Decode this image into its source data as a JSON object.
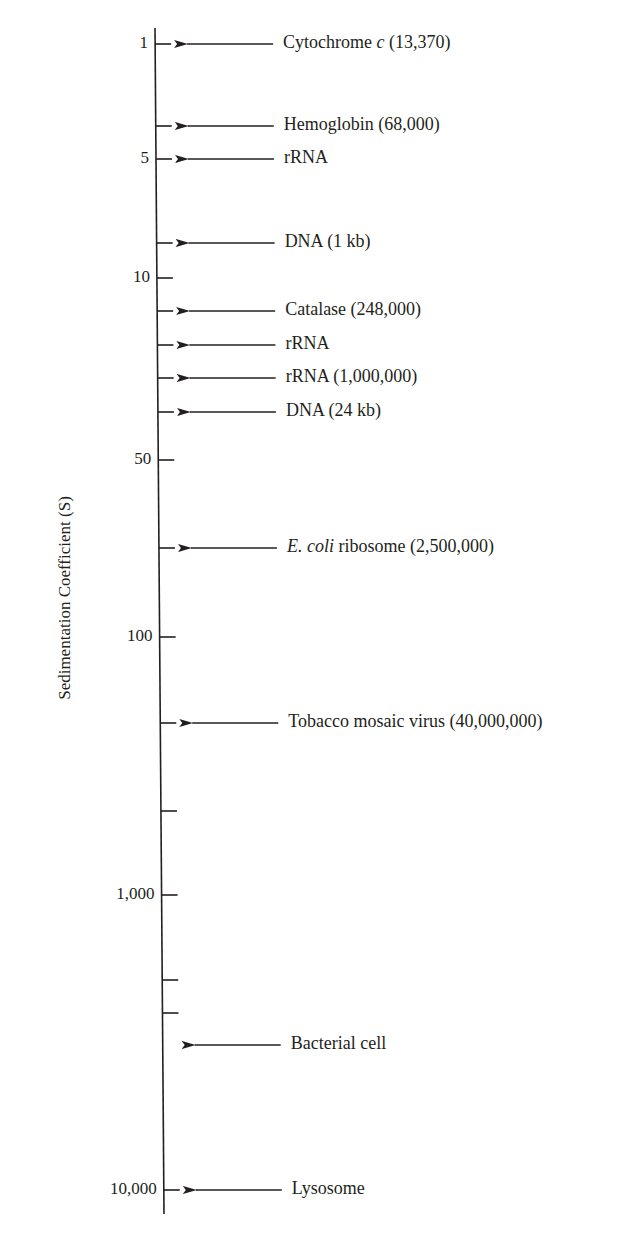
{
  "figure": {
    "axis_title": "Sedimentation Coefficient (S)",
    "axis": {
      "x_top": 155,
      "y_top": 28,
      "x_bottom": 164,
      "y_bottom": 1214
    },
    "ticks": [
      {
        "y": 44,
        "label": "1"
      },
      {
        "y": 126,
        "label": ""
      },
      {
        "y": 159,
        "label": "5"
      },
      {
        "y": 243,
        "label": ""
      },
      {
        "y": 278,
        "label": "10"
      },
      {
        "y": 311,
        "label": ""
      },
      {
        "y": 345,
        "label": ""
      },
      {
        "y": 378,
        "label": ""
      },
      {
        "y": 412,
        "label": ""
      },
      {
        "y": 460,
        "label": "50"
      },
      {
        "y": 548,
        "label": ""
      },
      {
        "y": 637,
        "label": "100"
      },
      {
        "y": 723,
        "label": ""
      },
      {
        "y": 811,
        "label": ""
      },
      {
        "y": 895,
        "label": "1,000"
      },
      {
        "y": 980,
        "label": ""
      },
      {
        "y": 1013,
        "label": ""
      },
      {
        "y": 1190,
        "label": "10,000"
      }
    ],
    "entries": [
      {
        "y": 44,
        "parts": [
          {
            "text": "Cytochrome ",
            "italic": false
          },
          {
            "text": "c",
            "italic": true
          },
          {
            "text": " (13,370)",
            "italic": false
          }
        ]
      },
      {
        "y": 126,
        "parts": [
          {
            "text": "Hemoglobin (68,000)",
            "italic": false
          }
        ]
      },
      {
        "y": 159,
        "parts": [
          {
            "text": "rRNA",
            "italic": false
          }
        ]
      },
      {
        "y": 243,
        "parts": [
          {
            "text": "DNA (1 kb)",
            "italic": false
          }
        ]
      },
      {
        "y": 311,
        "parts": [
          {
            "text": "Catalase (248,000)",
            "italic": false
          }
        ]
      },
      {
        "y": 345,
        "parts": [
          {
            "text": "rRNA",
            "italic": false
          }
        ]
      },
      {
        "y": 378,
        "parts": [
          {
            "text": "rRNA (1,000,000)",
            "italic": false
          }
        ]
      },
      {
        "y": 412,
        "parts": [
          {
            "text": "DNA (24 kb)",
            "italic": false
          }
        ]
      },
      {
        "y": 548,
        "parts": [
          {
            "text": "E. coli",
            "italic": true
          },
          {
            "text": " ribosome (2,500,000)",
            "italic": false
          }
        ]
      },
      {
        "y": 723,
        "parts": [
          {
            "text": "Tobacco mosaic virus (40,000,000)",
            "italic": false
          }
        ]
      },
      {
        "y": 1045,
        "parts": [
          {
            "text": "Bacterial cell",
            "italic": false
          }
        ]
      },
      {
        "y": 1190,
        "parts": [
          {
            "text": "Lysosome",
            "italic": false
          }
        ]
      }
    ]
  },
  "chart_data": {
    "type": "scale-diagram",
    "title": "",
    "ylabel": "Sedimentation Coefficient (S)",
    "scale": "log (schematic)",
    "axis_tick_labels": [
      "1",
      "5",
      "10",
      "50",
      "100",
      "1,000",
      "10,000"
    ],
    "items": [
      {
        "name": "Cytochrome c",
        "molecular_weight": "13,370",
        "approx_S": 1
      },
      {
        "name": "Hemoglobin",
        "molecular_weight": "68,000",
        "approx_S": 4
      },
      {
        "name": "rRNA",
        "molecular_weight": "",
        "approx_S": 5
      },
      {
        "name": "DNA (1 kb)",
        "molecular_weight": "",
        "approx_S": 7
      },
      {
        "name": "Catalase",
        "molecular_weight": "248,000",
        "approx_S": 11
      },
      {
        "name": "rRNA",
        "molecular_weight": "",
        "approx_S": 16
      },
      {
        "name": "rRNA",
        "molecular_weight": "1,000,000",
        "approx_S": 23
      },
      {
        "name": "DNA (24 kb)",
        "molecular_weight": "",
        "approx_S": 30
      },
      {
        "name": "E. coli ribosome",
        "molecular_weight": "2,500,000",
        "approx_S": 70
      },
      {
        "name": "Tobacco mosaic virus",
        "molecular_weight": "40,000,000",
        "approx_S": 200
      },
      {
        "name": "Bacterial cell",
        "molecular_weight": "",
        "approx_S": 3500
      },
      {
        "name": "Lysosome",
        "molecular_weight": "",
        "approx_S": 10000
      }
    ]
  }
}
